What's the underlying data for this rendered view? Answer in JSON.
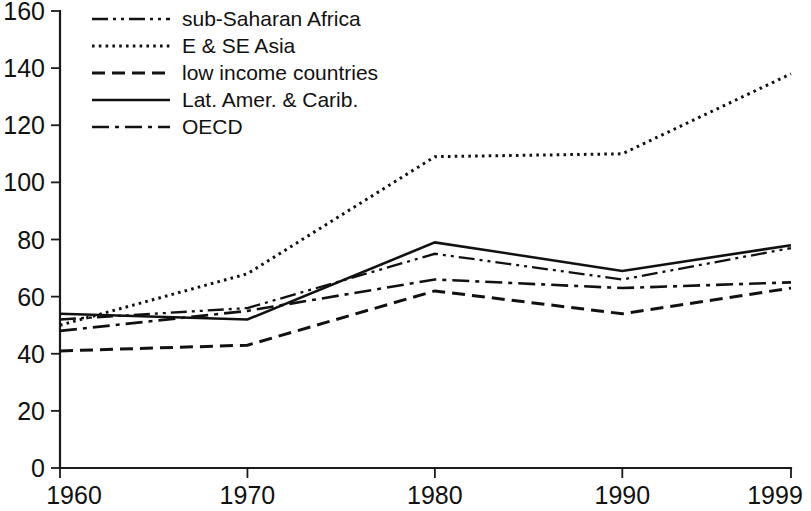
{
  "chart_data": {
    "type": "line",
    "title": "",
    "subtitle": "",
    "xlabel": "",
    "ylabel": "",
    "x": [
      1960,
      1970,
      1980,
      1990,
      1999
    ],
    "x_tick_labels": [
      "1960",
      "1970",
      "1980",
      "1990",
      "1999"
    ],
    "y_ticks": [
      0,
      20,
      40,
      60,
      80,
      100,
      120,
      140,
      160
    ],
    "y_tick_labels": [
      "0",
      "20",
      "40",
      "60",
      "80",
      "100",
      "120",
      "140",
      "160"
    ],
    "ylim": [
      0,
      160
    ],
    "xlim": [
      1960,
      1999
    ],
    "grid": false,
    "legend_position": "top-left",
    "line_color": "#111111",
    "series": [
      {
        "name": "sub-Saharan Africa",
        "dash": "dash-dot-dot",
        "dasharray": "16 5 3 5 3 5",
        "width": 2.3,
        "values": [
          52,
          56,
          75,
          66,
          77
        ]
      },
      {
        "name": "E & SE Asia",
        "dash": "dotted",
        "dasharray": "2.6 4.2",
        "width": 3.0,
        "values": [
          50,
          68,
          109,
          110,
          138
        ]
      },
      {
        "name": "low income countries",
        "dash": "dashed",
        "dasharray": "13 7",
        "width": 3.0,
        "values": [
          41,
          43,
          62,
          54,
          63
        ]
      },
      {
        "name": "Lat. Amer. & Carib.",
        "dash": "solid",
        "dasharray": "",
        "width": 2.6,
        "values": [
          54,
          52,
          79,
          69,
          78
        ]
      },
      {
        "name": "OECD",
        "dash": "dash-dot",
        "dasharray": "17 6 4 6",
        "width": 2.6,
        "values": [
          48,
          55,
          66,
          63,
          65
        ]
      }
    ]
  },
  "legend": {
    "items": [
      {
        "label": "sub-Saharan Africa"
      },
      {
        "label": "E & SE Asia"
      },
      {
        "label": "low income countries"
      },
      {
        "label": "Lat. Amer. & Carib."
      },
      {
        "label": "OECD"
      }
    ]
  }
}
